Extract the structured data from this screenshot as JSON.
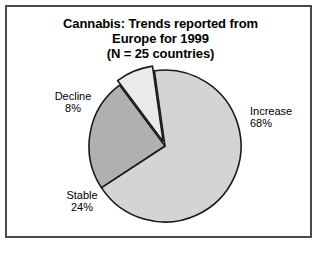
{
  "figure": {
    "title_lines": [
      "Cannabis: Trends reported from",
      "Europe for 1999",
      "(N = 25 countries)"
    ]
  },
  "chart_data": {
    "type": "pie",
    "title": "Cannabis: Trends reported from Europe for 1999 (N = 25 countries)",
    "categories": [
      "Increase",
      "Stable",
      "Decline"
    ],
    "values": [
      68,
      24,
      8
    ],
    "value_unit": "%",
    "labels": [
      {
        "name": "Increase",
        "percent": "68%",
        "value": 68,
        "color": "#d4d4d4"
      },
      {
        "name": "Stable",
        "percent": "24%",
        "value": 24,
        "color": "#b0b0b0"
      },
      {
        "name": "Decline",
        "percent": "8%",
        "value": 8,
        "color": "#eaeaea"
      }
    ],
    "legend": "none",
    "legend_position": "outside-labels",
    "grid": false,
    "xlabel": "",
    "ylabel": "",
    "sample_size": 25,
    "sample_label": "N = 25 countries",
    "year": "1999",
    "region": "Europe",
    "substance": "Cannabis"
  },
  "geometry": {
    "center_x": 158,
    "center_y": 139,
    "radius": 76,
    "start_angle_deg": -8,
    "exploded_slice": "Decline",
    "explode_offset": 5,
    "stroke": "#1a1a1a",
    "stroke_width": 1.6
  },
  "colors": {
    "frame": "#4a4a4a",
    "background": "#ffffff",
    "text": "#000000",
    "increase": "#d4d4d4",
    "stable": "#b0b0b0",
    "decline": "#eaeaea"
  }
}
